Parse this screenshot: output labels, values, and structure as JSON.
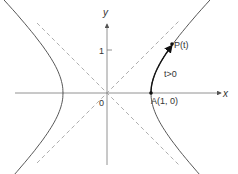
{
  "diagram": {
    "x_axis_label": "x",
    "y_axis_label": "y",
    "origin_label": "0",
    "y_tick_label": "1",
    "point_p_label": "P(t)",
    "point_a_label": "A(1, 0)",
    "arc_label": "t>0",
    "colors": {
      "axis": "#777777",
      "curve": "#333333",
      "asymptote": "#999999",
      "arc": "#111111"
    }
  }
}
